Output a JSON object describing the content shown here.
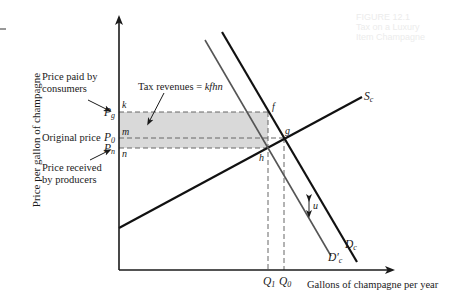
{
  "diagram": {
    "type": "supply-demand-tax-incidence",
    "y_axis_label": "Price per gallon of champagne",
    "x_axis_label": "Gallons of champagne per year",
    "annotations": {
      "price_paid": "Price paid by\nconsumers",
      "price_paid_line1": "Price paid by",
      "price_paid_line2": "consumers",
      "original_price": "Original price",
      "price_received_line1": "Price received",
      "price_received_line2": "by producers",
      "tax_revenues_prefix": "Tax revenues = ",
      "tax_revenues_area": "kfhn"
    },
    "price_ticks": [
      {
        "symbol": "P",
        "sub": "g",
        "id": "Pg"
      },
      {
        "symbol": "P",
        "sub": "0",
        "id": "P0"
      },
      {
        "symbol": "P",
        "sub": "n",
        "id": "Pn"
      }
    ],
    "quantity_ticks": [
      {
        "symbol": "Q",
        "sub": "1",
        "id": "Q1"
      },
      {
        "symbol": "Q",
        "sub": "0",
        "id": "Q0"
      }
    ],
    "points": {
      "k": "k",
      "m": "m",
      "n": "n",
      "f": "f",
      "g": "g",
      "h": "h"
    },
    "curves": [
      {
        "id": "Sc",
        "symbol": "S",
        "sub": "c",
        "kind": "supply"
      },
      {
        "id": "Dc",
        "symbol": "D",
        "sub": "c",
        "kind": "demand"
      },
      {
        "id": "Dc_prime",
        "symbol": "D",
        "sub": "c",
        "prime": "′",
        "kind": "demand-after-tax"
      }
    ],
    "tax_wedge_label": "u",
    "colors": {
      "axis": "#1a1a1a",
      "curve": "#111111",
      "shifted_curve": "#555555",
      "shade": "#d9d9d9",
      "dash": "#666666"
    },
    "ghost_bleed_text": [
      "FIGURE 12.1",
      "Tax on a Luxury",
      "Item Champagne"
    ]
  }
}
